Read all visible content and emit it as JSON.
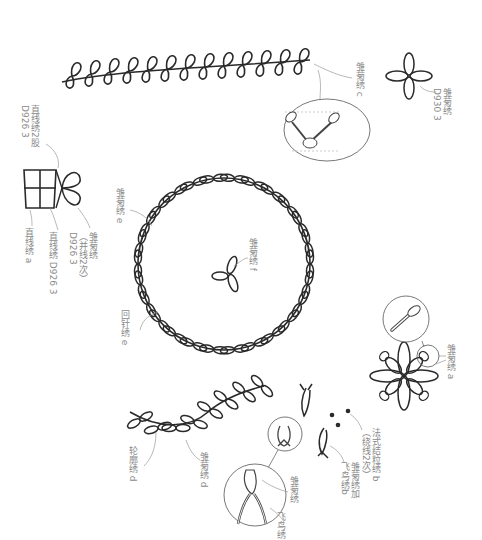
{
  "diagram": {
    "type": "embroidery-stitch-pattern",
    "text_orientation": "rotated-90-vertical",
    "colors": {
      "stroke": "#2a2a2a",
      "stroke_light": "#777777",
      "leader_line": "#9a9a9a",
      "label_text": "#8a8a8a",
      "background": "#ffffff"
    }
  },
  "labels": {
    "leaf_vine_top": "雏菊绣 c",
    "four_petal_flower": {
      "line1": "雏菊绣",
      "line2": "D930 3"
    },
    "gift_box_bow_top": {
      "line1": "直线绣2股",
      "line2": "D926 3"
    },
    "gift_box_bow": {
      "line1": "雏菊绣",
      "line2": "（并线2次）",
      "line3": "D926 3"
    },
    "gift_box_lines": "直线绣 D926 3",
    "gift_box_base": "直线绣 a",
    "wreath_leaves": "雏菊绣 e",
    "wreath_center": "雏菊绣 f",
    "wreath_ring": "回针绣 e",
    "big_flower": "雏菊绣 a",
    "french_knot": {
      "line1": "法式结粒绣 b",
      "line2": "（绕线2次）"
    },
    "small_fly": {
      "line1": "雏菊绣加",
      "line2": "飞鸟绣b"
    },
    "fly_detail_daisy": "雏菊绣",
    "fly_detail_fly": "飞鸟绣",
    "arc_daisy": "雏菊绣 d",
    "arc_stem": "轮廓绣 d"
  },
  "icons": {
    "leaf_vine": "loop-vine-icon",
    "four_petal": "four-petal-flower-icon",
    "gift_box": "gift-box-icon",
    "wreath": "leaf-wreath-icon",
    "big_flower": "eight-petal-flower-icon",
    "detail_circle": "magnifier-detail-icon"
  }
}
